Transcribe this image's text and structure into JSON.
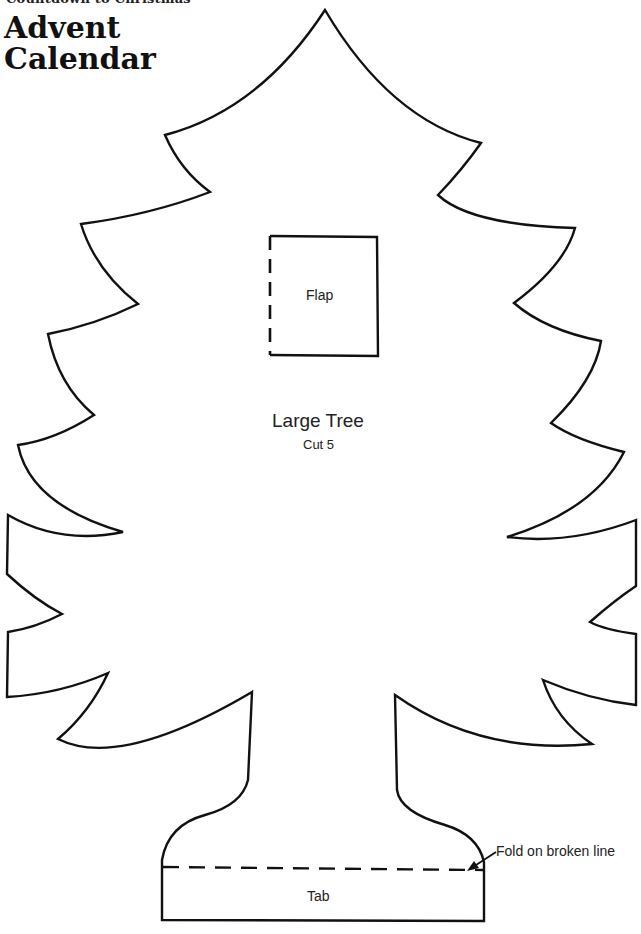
{
  "header": {
    "subtitle": "Countdown to Christmas",
    "title_line1": "Advent",
    "title_line2": "Calendar"
  },
  "pattern": {
    "name": "Large Tree",
    "instruction": "Cut 5",
    "flap_label": "Flap",
    "tab_label": "Tab",
    "fold_note": "Fold on broken line"
  },
  "colors": {
    "line": "#111111",
    "background": "#ffffff"
  }
}
